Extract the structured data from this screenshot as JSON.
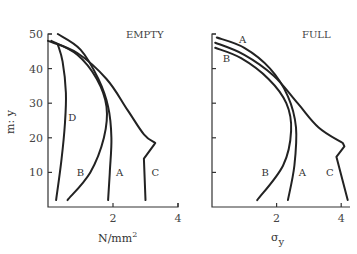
{
  "chart_data": [
    {
      "type": "line",
      "title": "EMPTY",
      "xlabel": "N/mm2",
      "xlabel_sup": "2",
      "xlabel_base": "N/mm",
      "ylabel": "m: y",
      "xlim": [
        0,
        4
      ],
      "ylim": [
        0,
        50
      ],
      "xticks": [
        2,
        4
      ],
      "yticks": [
        10,
        20,
        30,
        40,
        50
      ],
      "grid": false,
      "series": [
        {
          "name": "D",
          "points": [
            [
              0.3,
              47
            ],
            [
              0.45,
              42
            ],
            [
              0.55,
              33
            ],
            [
              0.52,
              24
            ],
            [
              0.42,
              14
            ],
            [
              0.25,
              2
            ]
          ],
          "label_pos": [
            0.75,
            25
          ]
        },
        {
          "name": "B",
          "points": [
            [
              0.1,
              48
            ],
            [
              0.9,
              44
            ],
            [
              1.5,
              37
            ],
            [
              1.8,
              29
            ],
            [
              1.72,
              20
            ],
            [
              1.3,
              10
            ],
            [
              0.6,
              2
            ]
          ],
          "label_pos": [
            1.0,
            9
          ]
        },
        {
          "name": "A",
          "points": [
            [
              0.3,
              50
            ],
            [
              1.0,
              45.5
            ],
            [
              1.55,
              37
            ],
            [
              1.85,
              29
            ],
            [
              1.95,
              20
            ],
            [
              1.9,
              10
            ],
            [
              1.85,
              2
            ]
          ],
          "label_pos": [
            2.2,
            9
          ]
        },
        {
          "name": "C",
          "points": [
            [
              0.0,
              48
            ],
            [
              0.9,
              44.5
            ],
            [
              1.8,
              37
            ],
            [
              2.45,
              28
            ],
            [
              2.95,
              21
            ],
            [
              3.3,
              18.5
            ],
            [
              3.25,
              17.8
            ],
            [
              2.95,
              14
            ],
            [
              3.0,
              2
            ]
          ],
          "label_pos": [
            3.3,
            9
          ]
        }
      ]
    },
    {
      "type": "line",
      "title": "FULL",
      "xlabel": "σy",
      "xlabel_base": "σ",
      "xlabel_sub": "y",
      "ylabel": "",
      "xlim": [
        0,
        4.2
      ],
      "ylim": [
        0,
        50
      ],
      "xticks": [
        2,
        4
      ],
      "yticks": [
        10,
        20,
        30,
        40,
        50
      ],
      "grid": false,
      "series": [
        {
          "name": "A",
          "points": [
            [
              0.15,
              49
            ],
            [
              1.0,
              46
            ],
            [
              1.8,
              40
            ],
            [
              2.35,
              32
            ],
            [
              2.6,
              23
            ],
            [
              2.55,
              12
            ],
            [
              2.35,
              2
            ]
          ],
          "label_pos": [
            0.95,
            47.5
          ]
        },
        {
          "name": "B",
          "points": [
            [
              0.1,
              46
            ],
            [
              0.9,
              43
            ],
            [
              1.75,
              37
            ],
            [
              2.3,
              30
            ],
            [
              2.45,
              22
            ],
            [
              2.2,
              12
            ],
            [
              1.4,
              2
            ]
          ],
          "label_pos": [
            0.45,
            42
          ]
        },
        {
          "name": "C",
          "points": [
            [
              0.1,
              47.5
            ],
            [
              1.0,
              44
            ],
            [
              1.9,
              38
            ],
            [
              2.65,
              30
            ],
            [
              3.3,
              23
            ],
            [
              4.05,
              18.5
            ],
            [
              4.1,
              17.5
            ],
            [
              3.85,
              14.5
            ],
            [
              4.2,
              2
            ]
          ],
          "label_pos": [
            3.65,
            9
          ]
        }
      ],
      "labels_bottom": [
        {
          "name": "B",
          "pos": [
            1.65,
            9
          ]
        },
        {
          "name": "A",
          "pos": [
            2.8,
            9
          ]
        }
      ]
    }
  ],
  "panels": {
    "left": {
      "title": "EMPTY",
      "xlabel_base": "N/mm",
      "xlabel_sup": "2",
      "ylabel": "m: y",
      "yticks": [
        "10",
        "20",
        "30",
        "40",
        "50"
      ],
      "xticks": [
        "2",
        "4"
      ]
    },
    "right": {
      "title": "FULL",
      "xlabel_base": "σ",
      "xlabel_sub": "y",
      "xticks": [
        "2",
        "4"
      ]
    }
  }
}
